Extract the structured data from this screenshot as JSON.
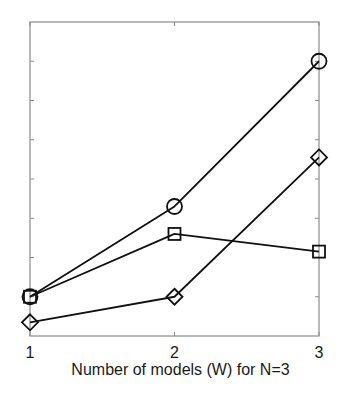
{
  "chart_data": {
    "type": "line",
    "title": "",
    "xlabel": "Number of models (W) for N=3",
    "ylabel": "",
    "x": [
      1,
      2,
      3
    ],
    "x_tick_labels": [
      "1",
      "2",
      "3"
    ],
    "xlim": [
      1,
      3
    ],
    "ylim": [
      0,
      8
    ],
    "y_ticks_count": 9,
    "y_tick_labels_shown": false,
    "grid": false,
    "legend": null,
    "series": [
      {
        "name": "circle-series",
        "marker": "circle",
        "values": [
          1.0,
          3.3,
          7.0
        ]
      },
      {
        "name": "square-series",
        "marker": "square",
        "values": [
          1.0,
          2.6,
          2.15
        ]
      },
      {
        "name": "diamond-series",
        "marker": "diamond",
        "values": [
          0.35,
          1.0,
          4.55
        ]
      }
    ]
  },
  "colors": {
    "frame": "#8a8a8a",
    "series_line": "#111111",
    "text": "#1a1a1a",
    "background": "#ffffff"
  },
  "layout": {
    "plot_left": 30,
    "plot_right": 319,
    "plot_top": 22,
    "plot_bottom": 336
  }
}
